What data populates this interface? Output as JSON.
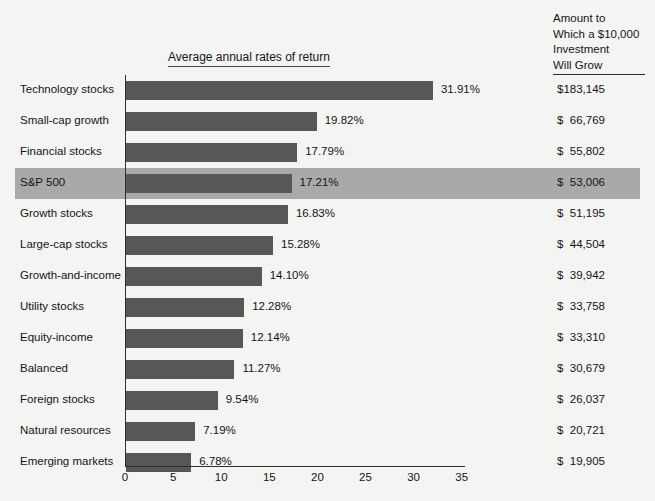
{
  "chart_data": {
    "type": "bar",
    "orientation": "horizontal",
    "title": "Average annual rates of return",
    "xlabel": "",
    "ylabel": "",
    "xlim": [
      0,
      35
    ],
    "x_ticks": [
      0,
      5,
      10,
      15,
      20,
      25,
      30,
      35
    ],
    "grid": false,
    "legend": null,
    "highlight_category": "S&P 500",
    "bar_color": "#575757",
    "highlight_row_color": "#a9a9a9",
    "background_color": "#f4f4f3",
    "categories": [
      "Technology stocks",
      "Small-cap growth",
      "Financial stocks",
      "S&P 500",
      "Growth stocks",
      "Large-cap stocks",
      "Growth-and-income",
      "Utility stocks",
      "Equity-income",
      "Balanced",
      "Foreign stocks",
      "Natural resources",
      "Emerging markets"
    ],
    "values": [
      31.91,
      19.82,
      17.79,
      17.21,
      16.83,
      15.28,
      14.1,
      12.28,
      12.14,
      11.27,
      9.54,
      7.19,
      6.78
    ],
    "value_labels": [
      "31.91%",
      "19.82%",
      "17.79%",
      "17.21%",
      "16.83%",
      "15.28%",
      "14.10%",
      "12.28%",
      "12.14%",
      "11.27%",
      "9.54%",
      "7.19%",
      "6.78%"
    ],
    "amounts": [
      "$183,145",
      "$  66,769",
      "$  55,802",
      "$  53,006",
      "$  51,195",
      "$  44,504",
      "$  39,942",
      "$  33,758",
      "$  33,310",
      "$  30,679",
      "$  26,037",
      "$  20,721",
      "$  19,905"
    ],
    "amount_column_header": "Amount to Which a $10,000 Investment Will Grow"
  },
  "amount_column": {
    "header_lines": [
      "Amount to",
      "Which a $10,000",
      "Investment",
      "Will Grow"
    ]
  },
  "x_axis": {
    "tick_labels": [
      "0",
      "5",
      "10",
      "15",
      "20",
      "25",
      "30",
      "35"
    ]
  }
}
